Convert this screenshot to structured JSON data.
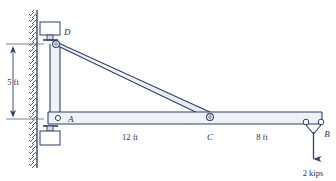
{
  "figure": {
    "kind": "structural-free-body-diagram",
    "colors": {
      "line": "#2b4168",
      "member_fill": "#dfe5ee",
      "wall_hatch": "#3a4f73",
      "background": "#ffffff",
      "text": "#1f3354"
    }
  },
  "labels": {
    "joint_d": "D",
    "joint_a": "A",
    "joint_c": "C",
    "joint_b": "B"
  },
  "dimensions": {
    "vertical_ad": "5 ft",
    "span_ac": "12 ft",
    "span_cb": "8 ft"
  },
  "load": {
    "magnitude": "2 kips",
    "direction": "down"
  },
  "geometry": {
    "wall_x": 36,
    "column_x": 56,
    "joint_d_y": 44,
    "joint_a_y": 119,
    "joint_c_x": 208,
    "joint_b_x": 318,
    "beam_top_y": 112,
    "beam_bottom_y": 124
  }
}
